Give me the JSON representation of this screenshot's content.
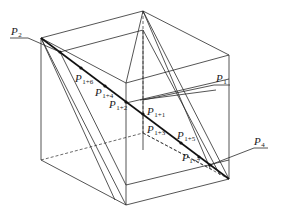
{
  "diagram": {
    "type": "cube-with-cutting-planes",
    "colors": {
      "line": "#2a2a2a",
      "main_line": "#111111",
      "background": "#ffffff"
    },
    "labels": {
      "p2": {
        "base": "P",
        "sub": "2"
      },
      "p1": {
        "base": "P",
        "sub": "1"
      },
      "p4": {
        "base": "P",
        "sub": "4"
      },
      "p1_6": {
        "base": "P",
        "sub": "1+6"
      },
      "p1_4": {
        "base": "P",
        "sub": "1+4"
      },
      "p1_2": {
        "base": "P",
        "sub": "1+2"
      },
      "p1_1": {
        "base": "P",
        "sub": "1+1"
      },
      "p1_3": {
        "base": "P",
        "sub": "1+3"
      },
      "p1_5": {
        "base": "P",
        "sub": "1+5"
      },
      "p1_7": {
        "base": "P",
        "sub": "1+7"
      }
    }
  }
}
